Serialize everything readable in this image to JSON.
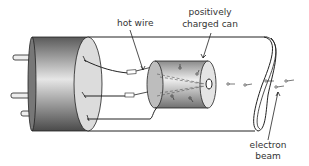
{
  "diagram": {
    "labels": {
      "hot_wire": "hot wire",
      "can_line1": "positively",
      "can_line2": "charged can",
      "beam_line1": "electron",
      "beam_line2": "beam"
    },
    "components": [
      "base cylinder with pins",
      "hot wire filament",
      "positively charged can",
      "glass tube",
      "electron beam"
    ],
    "colors": {
      "stroke": "#222222",
      "label": "#333333",
      "base_dark": "#555555",
      "base_light": "#e8e8e8",
      "can_dark": "#777777",
      "can_light": "#eeeeee"
    }
  }
}
